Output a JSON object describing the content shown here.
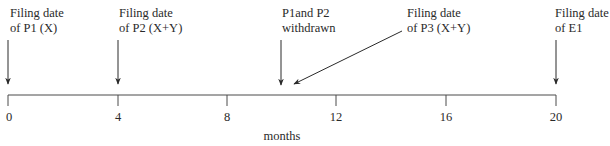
{
  "diagram": {
    "type": "timeline",
    "axis": {
      "label": "months",
      "ticks": [
        "0",
        "4",
        "8",
        "12",
        "16",
        "20"
      ],
      "tick_values": [
        0,
        4,
        8,
        12,
        16,
        20
      ],
      "range": [
        0,
        20
      ]
    },
    "events": [
      {
        "line1": "Filing date",
        "line2": "of P1 (X)",
        "month": 0
      },
      {
        "line1": "Filing date",
        "line2": "of P2 (X+Y)",
        "month": 4
      },
      {
        "line1": "P1and P2",
        "line2": "withdrawn",
        "month": 10
      },
      {
        "line1": "Filing date",
        "line2": "of P3 (X+Y)",
        "month": 10
      },
      {
        "line1": "Filing date",
        "line2": "of E1",
        "month": 20
      }
    ],
    "colors": {
      "line": "#3a3a3a",
      "text": "#2a2a2a",
      "background": "#ffffff"
    }
  }
}
